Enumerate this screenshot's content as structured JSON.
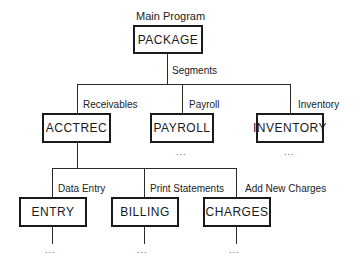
{
  "diagram": {
    "type": "hierarchy-chart",
    "root": {
      "caption": "Main Program",
      "label": "PACKAGE",
      "edge_label": "Segments"
    },
    "level1": [
      {
        "label": "ACCTREC",
        "edge_label": "Receivables"
      },
      {
        "label": "PAYROLL",
        "edge_label": "Payroll",
        "continuation": "..."
      },
      {
        "label": "INVENTORY",
        "edge_label": "Inventory",
        "continuation": "..."
      }
    ],
    "level2": [
      {
        "label": "ENTRY",
        "edge_label": "Data Entry",
        "continuation": "..."
      },
      {
        "label": "BILLING",
        "edge_label": "Print Statements",
        "continuation": "..."
      },
      {
        "label": "CHARGES",
        "edge_label": "Add New Charges",
        "continuation": "..."
      }
    ]
  }
}
